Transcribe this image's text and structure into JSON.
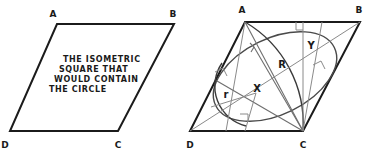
{
  "figure": {
    "title_present": false,
    "left_diagram": {
      "name": "isometric-square-parallelogram",
      "corner_labels": {
        "top_left": "A",
        "top_right": "B",
        "bottom_right": "C",
        "bottom_left": "D"
      },
      "caption_lines": [
        "THE ISOMETRIC",
        "SQUARE THAT",
        "WOULD CONTAIN",
        "THE CIRCLE"
      ]
    },
    "right_diagram": {
      "name": "isometric-circle-construction",
      "corner_labels": {
        "top_left": "A",
        "top_right": "B",
        "bottom_right": "C",
        "bottom_left": "D"
      },
      "measure_labels": [
        {
          "id": "R",
          "text": "R"
        },
        {
          "id": "r",
          "text": "r"
        },
        {
          "id": "X",
          "text": "X"
        },
        {
          "id": "Y",
          "text": "Y"
        }
      ],
      "right_angle_marks": 4
    },
    "colors": {
      "outline": "#1b1b1b",
      "construction_line": "#8a8a8a",
      "curve": "#4a4a4a",
      "text": "#1a1a1a",
      "background": "#ffffff"
    }
  }
}
